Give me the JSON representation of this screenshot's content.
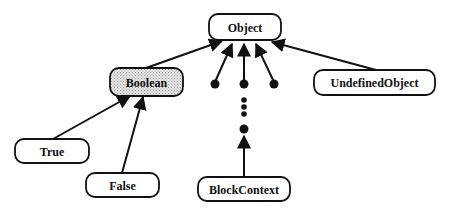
{
  "diagram": {
    "type": "class-hierarchy",
    "nodes": [
      {
        "id": "object",
        "label": "Object",
        "x": 209,
        "y": 14,
        "w": 72,
        "h": 26,
        "shaded": false
      },
      {
        "id": "boolean",
        "label": "Boolean",
        "x": 110,
        "y": 68,
        "w": 73,
        "h": 28,
        "shaded": true
      },
      {
        "id": "undefined-object",
        "label": "UndefinedObject",
        "x": 314,
        "y": 70,
        "w": 121,
        "h": 25,
        "shaded": false
      },
      {
        "id": "true",
        "label": "True",
        "x": 15,
        "y": 139,
        "w": 74,
        "h": 24,
        "shaded": false
      },
      {
        "id": "false",
        "label": "False",
        "x": 86,
        "y": 173,
        "w": 73,
        "h": 24,
        "shaded": false
      },
      {
        "id": "block-context",
        "label": "BlockContext",
        "x": 198,
        "y": 177,
        "w": 92,
        "h": 24,
        "shaded": false
      }
    ],
    "edges": [
      {
        "from": "boolean",
        "to": "object"
      },
      {
        "from": "undefined-object",
        "to": "object"
      },
      {
        "from": "true",
        "to": "boolean"
      },
      {
        "from": "false",
        "to": "boolean"
      },
      {
        "from": "dot-1",
        "to": "object"
      },
      {
        "from": "dot-2",
        "to": "object"
      },
      {
        "from": "dot-3",
        "to": "object"
      },
      {
        "from": "block-context",
        "to": "dot-chain"
      }
    ],
    "ellipsis_note": "unnamed subclasses shown as dots",
    "colors": {
      "stroke": "#111111",
      "shaded_fill": "#d9d9d9",
      "fill": "#ffffff"
    }
  }
}
